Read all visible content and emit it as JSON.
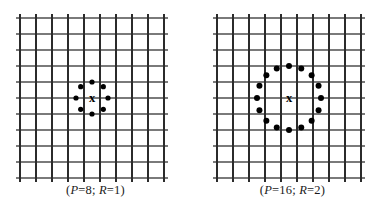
{
  "figure": {
    "type": "diagram",
    "background_color": "#ffffff",
    "grid_line_color_vertical": "#2b2b2b",
    "grid_line_color_horizontal": "#7a7a7a",
    "dot_color": "#000000",
    "center_marker_color": "#000000"
  },
  "panels": [
    {
      "id": "panel-left",
      "caption": {
        "full": "(P=8; R=1)",
        "open_paren": "(",
        "p_symbol": "P",
        "p_equals": "=",
        "p_value": "8",
        "separator": "; ",
        "r_symbol": "R",
        "r_equals": "=",
        "r_value": "1",
        "close_paren": ")"
      },
      "center_marker": "x",
      "grid": {
        "columns": 9,
        "rows": 10,
        "cell_size": 16,
        "x_origin": 12,
        "y_origin": 8,
        "width": 144,
        "height": 160,
        "tick_overhang": 4
      },
      "neighborhood": {
        "points": 8,
        "radius_cells": 1,
        "radius_px": 16,
        "center_x": 84,
        "center_y": 88,
        "dot_radius": 2.6,
        "dot_angles_deg": [
          90,
          45,
          0,
          315,
          270,
          225,
          180,
          135
        ]
      }
    },
    {
      "id": "panel-right",
      "caption": {
        "full": "(P=16; R=2)",
        "open_paren": "(",
        "p_symbol": "P",
        "p_equals": "=",
        "p_value": "16",
        "separator": "; ",
        "r_symbol": "R",
        "r_equals": "=",
        "r_value": "2",
        "close_paren": ")"
      },
      "center_marker": "x",
      "grid": {
        "columns": 9,
        "rows": 10,
        "cell_size": 16,
        "x_origin": 12,
        "y_origin": 8,
        "width": 144,
        "height": 160,
        "tick_overhang": 4
      },
      "neighborhood": {
        "points": 16,
        "radius_cells": 2,
        "radius_px": 32,
        "center_x": 84,
        "center_y": 88,
        "dot_radius": 3.0,
        "dot_angles_deg": [
          90,
          67.5,
          45,
          22.5,
          0,
          337.5,
          315,
          292.5,
          270,
          247.5,
          225,
          202.5,
          180,
          157.5,
          135,
          112.5
        ]
      }
    }
  ]
}
